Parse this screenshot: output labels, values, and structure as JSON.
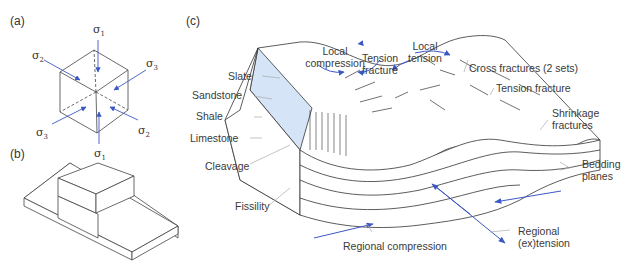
{
  "panels": {
    "a": "(a)",
    "b": "(b)",
    "c": "(c)"
  },
  "stress_labels": {
    "sigma": "σ",
    "s1_top": "1",
    "s1_bottom": "1",
    "s2_left": "2",
    "s2_right": "2",
    "s3_left": "3",
    "s3_right": "3"
  },
  "labels": {
    "slate": "Slate",
    "sandstone": "Sandstone",
    "shale": "Shale",
    "limestone": "Limestone",
    "cleavage": "Cleavage",
    "fissility": "Fissility",
    "local_compression_1": "Local",
    "local_compression_2": "compression",
    "tension_fracture_top_1": "Tension",
    "tension_fracture_top_2": "fracture",
    "local_tension_1": "Local",
    "local_tension_2": "tension",
    "cross_fractures": "Cross fractures (2 sets)",
    "tension_fracture_right": "Tension fracture",
    "shrinkage_1": "Shrinkage",
    "shrinkage_2": "fractures",
    "bedding_1": "Bedding",
    "bedding_2": "planes",
    "regional_compression": "Regional compression",
    "regional_extension_1": "Regional",
    "regional_extension_2": "(ex)tension"
  },
  "colors": {
    "arrow": "#3b57c4",
    "slate_fill": "#d6e4f7",
    "line": "#333333",
    "leader": "#aaaaaa"
  }
}
